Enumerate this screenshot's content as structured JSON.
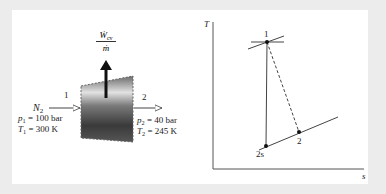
{
  "turbine_diagram": {
    "work_label": {
      "num": "Ẇ",
      "num_sub": "cv",
      "den": "ṁ"
    },
    "inlet": {
      "state": "1",
      "fluid": "N",
      "fluid_sub": "2",
      "pressure_var": "p",
      "pressure_sub": "1",
      "pressure_value": "= 100 bar",
      "temperature_var": "T",
      "temperature_sub": "1",
      "temperature_value": "= 300 K"
    },
    "outlet": {
      "state": "2",
      "pressure_var": "p",
      "pressure_sub": "2",
      "pressure_value": "= 40 bar",
      "temperature_var": "T",
      "temperature_sub": "2",
      "temperature_value": "= 245 K"
    }
  },
  "ts_diagram": {
    "y_axis_label": "T",
    "x_axis_label": "s",
    "points": {
      "p1": "1",
      "p2": "2",
      "p2s": "2s"
    }
  },
  "colors": {
    "background": "#ececec",
    "panel": "#ffffff",
    "line": "#333333",
    "turbine_dark": "#3a3a3a",
    "turbine_light": "#d8d8d8"
  }
}
